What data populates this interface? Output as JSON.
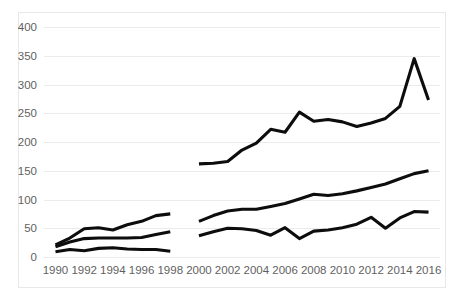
{
  "chart_data": {
    "type": "line",
    "title": "",
    "subtitle": "",
    "xlabel": "",
    "ylabel": "",
    "xlim": [
      1989.2,
      2016.8
    ],
    "ylim": [
      0,
      400
    ],
    "grid": true,
    "grid_axis": "y",
    "legend": "none",
    "line_color": "#0d0d0d",
    "background_color": "#ffffff",
    "grid_color": "#eceaea",
    "axis_text_color": "#5f5f5f",
    "y_ticks": [
      0,
      50,
      100,
      150,
      200,
      250,
      300,
      350,
      400
    ],
    "y_tick_labels": [
      "0",
      "50",
      "100",
      "150",
      "200",
      "250",
      "300",
      "350",
      "400"
    ],
    "x_ticks": [
      1990,
      1992,
      1994,
      1996,
      1998,
      2000,
      2002,
      2004,
      2006,
      2008,
      2010,
      2012,
      2014,
      2016
    ],
    "x_tick_labels": [
      "1990",
      "1992",
      "1994",
      "1996",
      "1998",
      "2000",
      "2002",
      "2004",
      "2006",
      "2008",
      "2010",
      "2012",
      "2014",
      "2016"
    ],
    "note": "Three unlabeled black series; each is broken into two segments with a data gap at 1999.",
    "series": [
      {
        "name": "series-top",
        "color": "#0d0d0d",
        "segments": [
          {
            "name": "segment-1990-1998",
            "x": [
              1990,
              1991,
              1992,
              1993,
              1994,
              1995,
              1996,
              1997,
              1998
            ],
            "values": [
              21,
              33,
              49,
              51,
              47,
              56,
              62,
              72,
              75
            ]
          },
          {
            "name": "segment-2000-2016",
            "x": [
              2000,
              2001,
              2002,
              2003,
              2004,
              2005,
              2006,
              2007,
              2008,
              2009,
              2010,
              2011,
              2012,
              2013,
              2014,
              2015,
              2016
            ],
            "values": [
              162,
              163,
              166,
              186,
              198,
              222,
              217,
              252,
              236,
              239,
              235,
              227,
              233,
              241,
              262,
              345,
              273
            ]
          }
        ]
      },
      {
        "name": "series-middle",
        "color": "#0d0d0d",
        "segments": [
          {
            "name": "segment-1990-1998",
            "x": [
              1990,
              1991,
              1992,
              1993,
              1994,
              1995,
              1996,
              1997,
              1998
            ],
            "values": [
              18,
              26,
              32,
              33,
              33,
              33,
              34,
              39,
              44
            ]
          },
          {
            "name": "segment-2000-2016",
            "x": [
              2000,
              2001,
              2002,
              2003,
              2004,
              2005,
              2006,
              2007,
              2008,
              2009,
              2010,
              2011,
              2012,
              2013,
              2014,
              2015,
              2016
            ],
            "values": [
              62,
              72,
              80,
              83,
              83,
              88,
              93,
              101,
              109,
              107,
              110,
              115,
              121,
              127,
              136,
              145,
              150
            ]
          }
        ]
      },
      {
        "name": "series-bottom",
        "color": "#0d0d0d",
        "segments": [
          {
            "name": "segment-1990-1998",
            "x": [
              1990,
              1991,
              1992,
              1993,
              1994,
              1995,
              1996,
              1997,
              1998
            ],
            "values": [
              9,
              13,
              11,
              15,
              16,
              14,
              13,
              13,
              10
            ]
          },
          {
            "name": "segment-2000-2016",
            "x": [
              2000,
              2001,
              2002,
              2003,
              2004,
              2005,
              2006,
              2007,
              2008,
              2009,
              2010,
              2011,
              2012,
              2013,
              2014,
              2015,
              2016
            ],
            "values": [
              37,
              44,
              50,
              49,
              46,
              38,
              51,
              32,
              45,
              47,
              51,
              57,
              69,
              50,
              68,
              79,
              78
            ]
          }
        ]
      }
    ]
  }
}
